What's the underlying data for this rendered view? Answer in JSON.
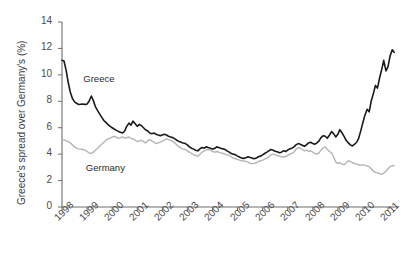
{
  "chart_data": {
    "type": "line",
    "title": "",
    "xlabel": "",
    "ylabel": "Greece's spread over Germany's (%)",
    "xlim": [
      1998,
      2011.4
    ],
    "ylim": [
      0,
      14
    ],
    "grid": false,
    "legend_position": "inline-annotations",
    "x_tick_labels": [
      "1998",
      "1999",
      "2000",
      "2001",
      "2002",
      "2003",
      "2004",
      "2005",
      "2006",
      "2007",
      "2008",
      "2009",
      "2010",
      "2011"
    ],
    "y_tick_labels": [
      "0",
      "2",
      "4",
      "6",
      "8",
      "10",
      "12",
      "14"
    ],
    "y_ticks": [
      0,
      2,
      4,
      6,
      8,
      10,
      12,
      14
    ],
    "annotations": [
      {
        "text": "Greece",
        "x": 1998.85,
        "y": 9.6
      },
      {
        "text": "Germany",
        "x": 1998.95,
        "y": 2.9
      }
    ],
    "series": [
      {
        "name": "Greece",
        "color": "#1a1a1a",
        "width": 1.6,
        "x": [
          1998.0,
          1998.08,
          1998.17,
          1998.25,
          1998.33,
          1998.42,
          1998.5,
          1998.58,
          1998.67,
          1998.75,
          1998.83,
          1998.92,
          1999.0,
          1999.08,
          1999.17,
          1999.25,
          1999.33,
          1999.42,
          1999.5,
          1999.58,
          1999.67,
          1999.75,
          1999.83,
          1999.92,
          2000.0,
          2000.08,
          2000.17,
          2000.25,
          2000.33,
          2000.42,
          2000.5,
          2000.58,
          2000.67,
          2000.75,
          2000.83,
          2000.92,
          2001.0,
          2001.08,
          2001.17,
          2001.25,
          2001.33,
          2001.42,
          2001.5,
          2001.58,
          2001.67,
          2001.75,
          2001.83,
          2001.92,
          2002.0,
          2002.08,
          2002.17,
          2002.25,
          2002.33,
          2002.42,
          2002.5,
          2002.58,
          2002.67,
          2002.75,
          2002.83,
          2002.92,
          2003.0,
          2003.08,
          2003.17,
          2003.25,
          2003.33,
          2003.42,
          2003.5,
          2003.58,
          2003.67,
          2003.75,
          2003.83,
          2003.92,
          2004.0,
          2004.08,
          2004.17,
          2004.25,
          2004.33,
          2004.42,
          2004.5,
          2004.58,
          2004.67,
          2004.75,
          2004.83,
          2004.92,
          2005.0,
          2005.08,
          2005.17,
          2005.25,
          2005.33,
          2005.42,
          2005.5,
          2005.58,
          2005.67,
          2005.75,
          2005.83,
          2005.92,
          2006.0,
          2006.08,
          2006.17,
          2006.25,
          2006.33,
          2006.42,
          2006.5,
          2006.58,
          2006.67,
          2006.75,
          2006.83,
          2006.92,
          2007.0,
          2007.08,
          2007.17,
          2007.25,
          2007.33,
          2007.42,
          2007.5,
          2007.58,
          2007.67,
          2007.75,
          2007.83,
          2007.92,
          2008.0,
          2008.08,
          2008.17,
          2008.25,
          2008.33,
          2008.42,
          2008.5,
          2008.58,
          2008.67,
          2008.75,
          2008.83,
          2008.92,
          2009.0,
          2009.08,
          2009.17,
          2009.25,
          2009.33,
          2009.42,
          2009.5,
          2009.58,
          2009.67,
          2009.75,
          2009.83,
          2009.92,
          2010.0,
          2010.08,
          2010.17,
          2010.25,
          2010.33,
          2010.42,
          2010.5,
          2010.58,
          2010.67,
          2010.75,
          2010.83,
          2010.92,
          2011.0,
          2011.08,
          2011.17,
          2011.25
        ],
        "values": [
          11.1,
          11.05,
          10.3,
          9.4,
          8.7,
          8.2,
          7.95,
          7.85,
          7.75,
          7.78,
          7.8,
          7.75,
          7.8,
          8.0,
          8.4,
          8.05,
          7.6,
          7.3,
          7.05,
          6.8,
          6.55,
          6.4,
          6.25,
          6.1,
          6.0,
          5.9,
          5.8,
          5.72,
          5.65,
          5.6,
          5.75,
          6.1,
          6.35,
          6.2,
          6.5,
          6.3,
          6.1,
          6.25,
          6.15,
          6.0,
          5.85,
          5.75,
          5.6,
          5.55,
          5.6,
          5.5,
          5.45,
          5.4,
          5.45,
          5.5,
          5.45,
          5.35,
          5.3,
          5.25,
          5.15,
          5.05,
          4.95,
          4.9,
          4.85,
          4.8,
          4.7,
          4.55,
          4.45,
          4.38,
          4.3,
          4.25,
          4.4,
          4.5,
          4.45,
          4.55,
          4.5,
          4.45,
          4.38,
          4.42,
          4.55,
          4.5,
          4.45,
          4.4,
          4.35,
          4.25,
          4.15,
          4.05,
          4.0,
          3.95,
          3.85,
          3.78,
          3.7,
          3.68,
          3.72,
          3.8,
          3.75,
          3.7,
          3.65,
          3.7,
          3.8,
          3.85,
          3.95,
          4.05,
          4.15,
          4.25,
          4.35,
          4.3,
          4.22,
          4.18,
          4.1,
          4.15,
          4.25,
          4.2,
          4.3,
          4.4,
          4.45,
          4.55,
          4.7,
          4.8,
          4.75,
          4.68,
          4.6,
          4.7,
          4.85,
          4.9,
          4.8,
          4.75,
          4.85,
          5.0,
          5.25,
          5.4,
          5.35,
          5.2,
          5.45,
          5.7,
          5.55,
          5.3,
          5.5,
          5.85,
          5.6,
          5.35,
          5.05,
          4.85,
          4.7,
          4.62,
          4.75,
          4.9,
          5.2,
          5.8,
          6.4,
          6.95,
          7.4,
          7.2,
          8.0,
          8.6,
          9.2,
          9.0,
          9.8,
          10.4,
          11.1,
          10.3,
          10.6,
          11.4,
          11.9,
          11.7
        ]
      },
      {
        "name": "Germany",
        "color": "#b4b4b4",
        "width": 1.4,
        "x": [
          1998.0,
          1998.08,
          1998.17,
          1998.25,
          1998.33,
          1998.42,
          1998.5,
          1998.58,
          1998.67,
          1998.75,
          1998.83,
          1998.92,
          1999.0,
          1999.08,
          1999.17,
          1999.25,
          1999.33,
          1999.42,
          1999.5,
          1999.58,
          1999.67,
          1999.75,
          1999.83,
          1999.92,
          2000.0,
          2000.08,
          2000.17,
          2000.25,
          2000.33,
          2000.42,
          2000.5,
          2000.58,
          2000.67,
          2000.75,
          2000.83,
          2000.92,
          2001.0,
          2001.08,
          2001.17,
          2001.25,
          2001.33,
          2001.42,
          2001.5,
          2001.58,
          2001.67,
          2001.75,
          2001.83,
          2001.92,
          2002.0,
          2002.08,
          2002.17,
          2002.25,
          2002.33,
          2002.42,
          2002.5,
          2002.58,
          2002.67,
          2002.75,
          2002.83,
          2002.92,
          2003.0,
          2003.08,
          2003.17,
          2003.25,
          2003.33,
          2003.42,
          2003.5,
          2003.58,
          2003.67,
          2003.75,
          2003.83,
          2003.92,
          2004.0,
          2004.08,
          2004.17,
          2004.25,
          2004.33,
          2004.42,
          2004.5,
          2004.58,
          2004.67,
          2004.75,
          2004.83,
          2004.92,
          2005.0,
          2005.08,
          2005.17,
          2005.25,
          2005.33,
          2005.42,
          2005.5,
          2005.58,
          2005.67,
          2005.75,
          2005.83,
          2005.92,
          2006.0,
          2006.08,
          2006.17,
          2006.25,
          2006.33,
          2006.42,
          2006.5,
          2006.58,
          2006.67,
          2006.75,
          2006.83,
          2006.92,
          2007.0,
          2007.08,
          2007.17,
          2007.25,
          2007.33,
          2007.42,
          2007.5,
          2007.58,
          2007.67,
          2007.75,
          2007.83,
          2007.92,
          2008.0,
          2008.08,
          2008.17,
          2008.25,
          2008.33,
          2008.42,
          2008.5,
          2008.58,
          2008.67,
          2008.75,
          2008.83,
          2008.92,
          2009.0,
          2009.08,
          2009.17,
          2009.25,
          2009.33,
          2009.42,
          2009.5,
          2009.58,
          2009.67,
          2009.75,
          2009.83,
          2009.92,
          2010.0,
          2010.08,
          2010.17,
          2010.25,
          2010.33,
          2010.42,
          2010.5,
          2010.58,
          2010.67,
          2010.75,
          2010.83,
          2010.92,
          2011.0,
          2011.08,
          2011.17,
          2011.25
        ],
        "values": [
          5.1,
          5.08,
          5.0,
          4.95,
          4.85,
          4.7,
          4.55,
          4.45,
          4.4,
          4.38,
          4.35,
          4.3,
          4.2,
          4.1,
          4.05,
          4.15,
          4.3,
          4.45,
          4.6,
          4.75,
          4.9,
          5.05,
          5.15,
          5.2,
          5.3,
          5.35,
          5.28,
          5.2,
          5.25,
          5.3,
          5.2,
          5.25,
          5.3,
          5.2,
          5.15,
          5.05,
          4.95,
          5.0,
          5.05,
          4.95,
          4.85,
          5.0,
          5.1,
          5.0,
          4.9,
          4.8,
          4.85,
          4.9,
          5.0,
          5.05,
          5.15,
          5.1,
          5.05,
          4.95,
          4.85,
          4.7,
          4.55,
          4.45,
          4.4,
          4.35,
          4.25,
          4.15,
          4.05,
          3.95,
          3.9,
          3.85,
          4.0,
          4.15,
          4.25,
          4.3,
          4.35,
          4.3,
          4.2,
          4.15,
          4.2,
          4.15,
          4.1,
          4.05,
          4.0,
          3.95,
          3.9,
          3.8,
          3.7,
          3.65,
          3.6,
          3.55,
          3.5,
          3.48,
          3.45,
          3.4,
          3.3,
          3.28,
          3.3,
          3.35,
          3.45,
          3.5,
          3.55,
          3.62,
          3.7,
          3.8,
          3.95,
          4.0,
          3.95,
          3.9,
          3.85,
          3.8,
          3.78,
          3.82,
          3.9,
          4.0,
          4.05,
          4.15,
          4.35,
          4.5,
          4.45,
          4.35,
          4.25,
          4.3,
          4.2,
          4.25,
          4.15,
          4.05,
          4.0,
          4.1,
          4.3,
          4.5,
          4.55,
          4.35,
          4.2,
          4.1,
          3.8,
          3.4,
          3.3,
          3.35,
          3.25,
          3.2,
          3.35,
          3.5,
          3.45,
          3.35,
          3.3,
          3.25,
          3.2,
          3.15,
          3.2,
          3.15,
          3.1,
          3.05,
          2.9,
          2.7,
          2.62,
          2.58,
          2.52,
          2.48,
          2.55,
          2.7,
          2.9,
          3.05,
          3.1,
          3.15
        ]
      }
    ]
  }
}
